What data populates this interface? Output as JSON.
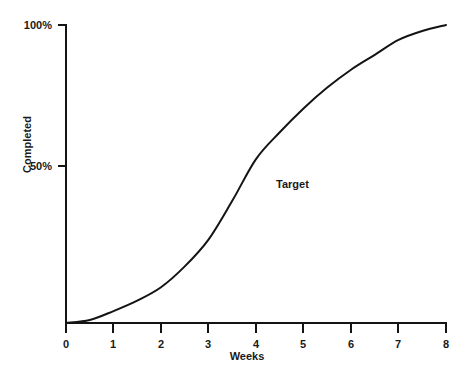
{
  "chart_data": {
    "type": "line",
    "title": "",
    "subtitle": "",
    "xlabel": "Weeks",
    "ylabel": "Completed",
    "xlim": [
      0,
      8
    ],
    "ylim": [
      0,
      100
    ],
    "grid": false,
    "legend": "none",
    "x_ticks": [
      "0",
      "1",
      "2",
      "3",
      "4",
      "5",
      "6",
      "7",
      "8"
    ],
    "x_tick_values": [
      0,
      1,
      2,
      3,
      4,
      5,
      6,
      7,
      8
    ],
    "y_ticks": [
      "50%",
      "100%"
    ],
    "y_tick_values": [
      50,
      100
    ],
    "annotations": [
      {
        "text": "Target",
        "x": 4.7,
        "y": 45
      }
    ],
    "series": [
      {
        "name": "Target",
        "color": "#141414",
        "x": [
          0,
          0.5,
          1,
          1.5,
          2,
          2.5,
          3,
          3.5,
          4,
          4.5,
          5,
          5.5,
          6,
          6.5,
          7,
          7.5,
          8
        ],
        "values": [
          0,
          1,
          4,
          7.5,
          12,
          19,
          28,
          41,
          55,
          64,
          72,
          79,
          85,
          90,
          95,
          98,
          100
        ]
      }
    ]
  },
  "axes": {
    "x_title": "Weeks",
    "y_title": "Completed",
    "x_tick_labels": [
      "0",
      "1",
      "2",
      "3",
      "4",
      "5",
      "6",
      "7",
      "8"
    ],
    "y_tick_labels": [
      "50%",
      "100%"
    ]
  },
  "annotation": {
    "target_label": "Target"
  },
  "colors": {
    "curve": "#141414",
    "axis": "#141414",
    "text": "#1a1a1a",
    "background": "#ffffff"
  }
}
